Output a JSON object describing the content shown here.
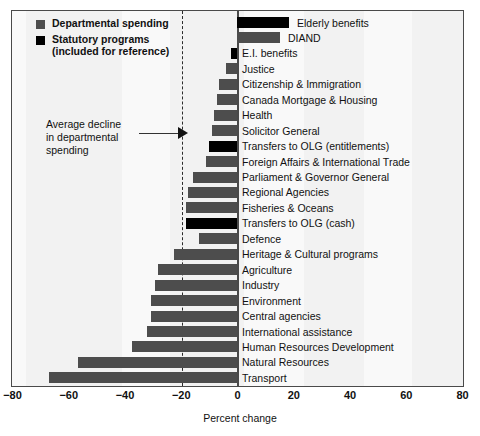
{
  "legend": {
    "items": [
      {
        "label": "Departmental spending",
        "sub": "",
        "color": "#4d4d4d",
        "key": "dept"
      },
      {
        "label": "Statutory programs",
        "sub": "(included for reference)",
        "color": "#000000",
        "key": "stat"
      }
    ]
  },
  "annotation": {
    "line1": "Average decline",
    "line2": "in departmental",
    "line3": "spending",
    "value": -19.4
  },
  "axis": {
    "xlabel": "Percent change",
    "ticks": [
      "-80",
      "-60",
      "-40",
      "-20",
      "0",
      "20",
      "40",
      "60",
      "80"
    ],
    "tick_values": [
      -80,
      -60,
      -40,
      -20,
      0,
      20,
      40,
      60,
      80
    ]
  },
  "chart_data": {
    "type": "bar",
    "orientation": "horizontal",
    "title": "",
    "xlabel": "Percent change",
    "ylabel": "",
    "xlim": [
      -80,
      80
    ],
    "grid": false,
    "legend_position": "top-left",
    "reference_line": {
      "value": -19.4,
      "style": "dashed",
      "label": "Average decline in departmental spending"
    },
    "categories": [
      "Elderly benefits",
      "DIAND",
      "E.I. benefits",
      "Justice",
      "Citizenship & Immigration",
      "Canada Mortgage & Housing",
      "Health",
      "Solicitor General",
      "Transfers to OLG (entitlements)",
      "Foreign Affairs & International Trade",
      "Parliament & Governor General",
      "Regional Agencies",
      "Fisheries & Oceans",
      "Transfers to OLG (cash)",
      "Defence",
      "Heritage & Cultural programs",
      "Agriculture",
      "Industry",
      "Environment",
      "Central agencies",
      "International assistance",
      "Human Resources Development",
      "Natural Resources",
      "Transport"
    ],
    "values": [
      18.5,
      15.3,
      -2.1,
      -4.0,
      -6.5,
      -7.0,
      -8.3,
      -9.0,
      -9.8,
      -11.0,
      -15.5,
      -17.5,
      -18.0,
      -18.2,
      -13.5,
      -22.5,
      -28.0,
      -29.0,
      -30.5,
      -30.5,
      -32.0,
      -37.5,
      -56.5,
      -67.0
    ],
    "series_type": [
      "stat",
      "dept",
      "stat",
      "dept",
      "dept",
      "dept",
      "dept",
      "dept",
      "stat",
      "dept",
      "dept",
      "dept",
      "dept",
      "stat",
      "dept",
      "dept",
      "dept",
      "dept",
      "dept",
      "dept",
      "dept",
      "dept",
      "dept",
      "dept"
    ],
    "series": [
      {
        "name": "Departmental spending",
        "color": "#4d4d4d"
      },
      {
        "name": "Statutory programs",
        "color": "#000000"
      }
    ]
  }
}
